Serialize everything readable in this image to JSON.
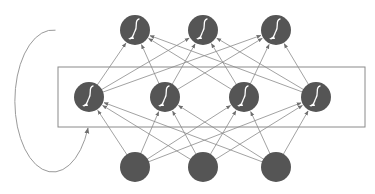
{
  "diagram": {
    "type": "recurrent-neural-network",
    "colors": {
      "node_fill": "#555555",
      "edge": "#8a8a8a",
      "box": "#8a8a8a",
      "loop": "#9a9a9a",
      "glyph": "#ffffff",
      "background": "#ffffff"
    },
    "node_radius": 15,
    "layers": [
      {
        "name": "output-layer",
        "activation_icon": "sigmoid-icon",
        "nodes": [
          {
            "cx": 135,
            "cy": 30
          },
          {
            "cx": 203,
            "cy": 30
          },
          {
            "cx": 276,
            "cy": 30
          }
        ]
      },
      {
        "name": "hidden-layer",
        "activation_icon": "sigmoid-icon",
        "nodes": [
          {
            "cx": 89,
            "cy": 97
          },
          {
            "cx": 165,
            "cy": 97
          },
          {
            "cx": 244,
            "cy": 97
          },
          {
            "cx": 316,
            "cy": 97
          }
        ]
      },
      {
        "name": "input-layer",
        "activation_icon": null,
        "nodes": [
          {
            "cx": 135,
            "cy": 167
          },
          {
            "cx": 203,
            "cy": 167
          },
          {
            "cx": 276,
            "cy": 167
          }
        ]
      }
    ],
    "connections": [
      {
        "from": "input-layer",
        "to": "hidden-layer",
        "pattern": "fully-connected"
      },
      {
        "from": "hidden-layer",
        "to": "output-layer",
        "pattern": "fully-connected"
      }
    ],
    "hidden_box": {
      "x": 58,
      "y": 67,
      "width": 307,
      "height": 60
    },
    "recurrent_loop": {
      "cx": 46,
      "cy": 99,
      "rx": 38,
      "ry": 71,
      "arrow_tip": {
        "x": 88,
        "y": 128
      }
    }
  }
}
